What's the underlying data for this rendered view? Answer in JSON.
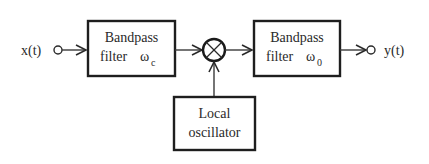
{
  "diagram": {
    "type": "block-diagram",
    "input": {
      "label": "x(t)"
    },
    "output": {
      "label": "y(t)"
    },
    "blocks": [
      {
        "id": "bpf1",
        "line1": "Bandpass",
        "line2": "filter",
        "symbol": "ω",
        "subscript": "c"
      },
      {
        "id": "mixer",
        "symbol": "⊗",
        "kind": "multiplier"
      },
      {
        "id": "bpf2",
        "line1": "Bandpass",
        "line2": "filter",
        "symbol": "ω",
        "subscript": "0"
      },
      {
        "id": "lo",
        "line1": "Local",
        "line2": "oscillator"
      }
    ],
    "edges": [
      {
        "from": "input",
        "to": "bpf1"
      },
      {
        "from": "bpf1",
        "to": "mixer"
      },
      {
        "from": "lo",
        "to": "mixer"
      },
      {
        "from": "mixer",
        "to": "bpf2"
      },
      {
        "from": "bpf2",
        "to": "output"
      }
    ],
    "colors": {
      "stroke": "#1e1e1e",
      "text": "#2a2a2a",
      "background": "#ffffff"
    }
  }
}
